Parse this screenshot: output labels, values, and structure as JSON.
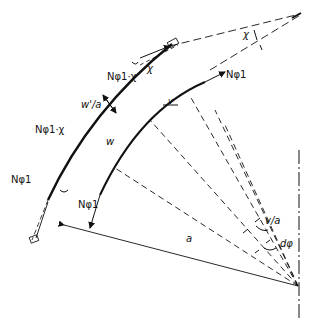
{
  "diagram": {
    "type": "shell-element-free-body",
    "labels": {
      "n_phi_chi_top": "Nφ1·χ",
      "chi_top": "χ",
      "chi_far": "χ",
      "n_phi_top_right": "Nφ1",
      "w_prime_over_a": "w'/a",
      "n_phi_chi_left": "Nφ1·χ",
      "w": "w",
      "n_phi_left": "Nφ1",
      "n_phi_bottom": "Nφ1",
      "v_over_a": "v/a",
      "d_phi": "dφ",
      "a": "a",
      "v": "v"
    },
    "colors": {
      "ink": "#111111",
      "background": "#ffffff"
    }
  }
}
